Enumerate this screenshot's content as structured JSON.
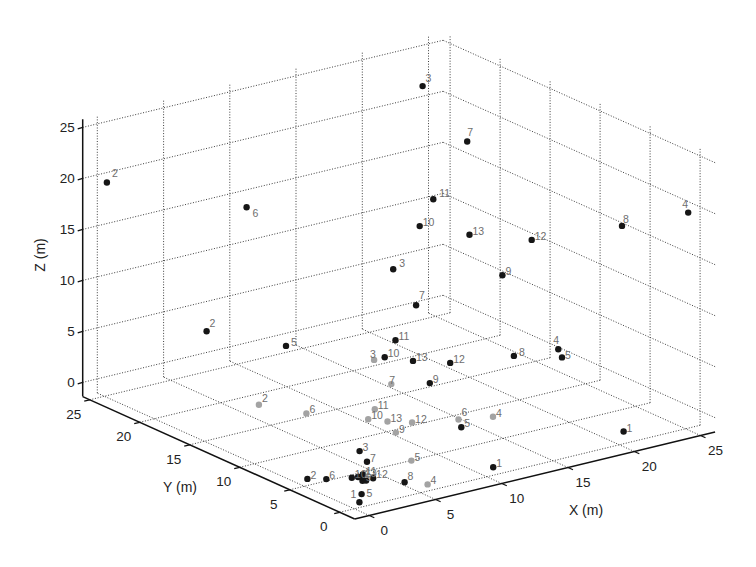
{
  "figure": {
    "background": "#ffffff"
  },
  "chart_data": {
    "type": "scatter",
    "dimensions": 3,
    "title": "",
    "xlabel": "X (m)",
    "ylabel": "Y (m)",
    "zlabel": "Z (m)",
    "xlim": [
      -1.1,
      26.1
    ],
    "ylim": [
      -1.5,
      25.7
    ],
    "zlim": [
      -1.4,
      25.8
    ],
    "xticks": [
      0,
      5,
      10,
      15,
      20,
      25
    ],
    "yticks": [
      0,
      5,
      10,
      15,
      20,
      25
    ],
    "zticks": [
      0,
      5,
      10,
      15,
      20,
      25
    ],
    "grid": true,
    "grid_style": "dotted",
    "legend": null,
    "label_color": "#6e6e6e",
    "series": [
      {
        "id": "dark",
        "color": "#161616",
        "points": [
          {
            "label": "2",
            "x": 0.2,
            "y": 25.0,
            "z": 19.5,
            "ldx": 5,
            "ldy": -6
          },
          {
            "label": "6",
            "x": 3.8,
            "y": 15.8,
            "z": 20,
            "ldx": 6,
            "ldy": 10
          },
          {
            "label": "3",
            "x": 20.1,
            "y": 19.8,
            "z": 25,
            "ldy": -4
          },
          {
            "label": "7",
            "x": 21.8,
            "y": 17.6,
            "z": 20,
            "ldx": 0,
            "ldy": -6
          },
          {
            "label": "8",
            "x": 20.2,
            "y": 0.0,
            "z": 20,
            "ldx": 1,
            "ldy": -3
          },
          {
            "label": "4",
            "x": 24.9,
            "y": -0.4,
            "z": 20,
            "ldx": -6,
            "ldy": -5
          },
          {
            "label": "11",
            "x": 19.4,
            "y": 17.8,
            "z": 15,
            "ldx": 6,
            "ldy": -2
          },
          {
            "label": "10",
            "x": 15.8,
            "y": 14.4,
            "z": 15
          },
          {
            "label": "13",
            "x": 17.3,
            "y": 11.4,
            "z": 15
          },
          {
            "label": "12",
            "x": 19.8,
            "y": 8.5,
            "z": 15
          },
          {
            "label": "3",
            "x": 9.8,
            "y": 9.1,
            "z": 15,
            "ldx": 6,
            "ldy": -2
          },
          {
            "label": "9",
            "x": 14.5,
            "y": 4.4,
            "z": 15
          },
          {
            "label": "7",
            "x": 7.0,
            "y": 3.1,
            "z": 15,
            "ldy": -6
          },
          {
            "label": "2",
            "x": 5.0,
            "y": 21.4,
            "z": 5,
            "ldy": -4
          },
          {
            "label": "5",
            "x": 7.3,
            "y": 16.5,
            "z": 5,
            "ldx": 5
          },
          {
            "label": "11",
            "x": 13.3,
            "y": 13.5,
            "z": 5
          },
          {
            "label": "10",
            "x": 10.9,
            "y": 11.4,
            "z": 5
          },
          {
            "label": "13",
            "x": 11.9,
            "y": 9.9,
            "z": 5
          },
          {
            "label": "12",
            "x": 13.5,
            "y": 8.3,
            "z": 5
          },
          {
            "label": "9",
            "x": 10.3,
            "y": 6.1,
            "z": 5
          },
          {
            "label": "8",
            "x": 17.4,
            "y": 7.1,
            "z": 5,
            "ldx": 5
          },
          {
            "label": "4",
            "x": 20.3,
            "y": 6.5,
            "z": 5,
            "ldx": -5,
            "ldy": -5
          },
          {
            "label": "5",
            "x": 19.6,
            "y": 5.2,
            "z": 5,
            "ldy": 2
          },
          {
            "label": "3",
            "x": 5.0,
            "y": 6.1,
            "z": 0
          },
          {
            "label": "7",
            "x": 4.2,
            "y": 4.3,
            "z": 0
          },
          {
            "label": "2",
            "x": -0.6,
            "y": 3.9,
            "z": 0
          },
          {
            "label": "6",
            "x": 0.3,
            "y": 3.2,
            "z": 0
          },
          {
            "label": "11",
            "x": 2.6,
            "y": 2.6,
            "z": 0
          },
          {
            "label": "10",
            "x": 1.7,
            "y": 2.5,
            "z": 0
          },
          {
            "label": "13",
            "x": 2.3,
            "y": 2.3,
            "z": 0
          },
          {
            "label": "12",
            "x": 2.7,
            "y": 1.7,
            "z": 0
          },
          {
            "label": "9",
            "x": 1.9,
            "y": 1.7,
            "z": 0
          },
          {
            "label": null,
            "x": 2.1,
            "y": 2.4,
            "z": 0
          },
          {
            "label": null,
            "x": 2.1,
            "y": 1.6,
            "z": 0
          },
          {
            "label": "5",
            "x": 0.4,
            "y": -0.2,
            "z": 0,
            "ldx": 5,
            "ldy": 3
          },
          {
            "label": "1",
            "x": -0.6,
            "y": -1.3,
            "z": 0,
            "ldx": -9,
            "ldy": -4
          },
          {
            "label": "8",
            "x": 3.8,
            "y": 0.0,
            "z": 0,
            "ldy": -2
          },
          {
            "label": "1",
            "x": 9.8,
            "y": -0.9,
            "z": 0
          },
          {
            "label": "5",
            "x": 12.6,
            "y": 6.0,
            "z": 0
          },
          {
            "label": "1",
            "x": 20.1,
            "y": -0.3,
            "z": 0
          }
        ]
      },
      {
        "id": "light",
        "color": "#a3a3a3",
        "points": [
          {
            "label": "3",
            "x": 10.1,
            "y": 11.4,
            "z": 5,
            "ldx": -4,
            "ldy": -2
          },
          {
            "label": "7",
            "x": 8.3,
            "y": 7.3,
            "z": 5,
            "ldx": -2
          },
          {
            "label": "2",
            "x": 5.1,
            "y": 16.3,
            "z": 0,
            "ldy": -3
          },
          {
            "label": "6",
            "x": 6.5,
            "y": 13.4,
            "z": 0
          },
          {
            "label": "11",
            "x": 10.3,
            "y": 11.6,
            "z": 0
          },
          {
            "label": "10",
            "x": 8.9,
            "y": 10.4,
            "z": 0
          },
          {
            "label": "13",
            "x": 9.6,
            "y": 9.4,
            "z": 0
          },
          {
            "label": "12",
            "x": 10.7,
            "y": 8.4,
            "z": 0
          },
          {
            "label": "9",
            "x": 8.8,
            "y": 7.5,
            "z": 0
          },
          {
            "label": "6",
            "x": 13.3,
            "y": 7.2,
            "z": 0,
            "ldy": -4
          },
          {
            "label": "4",
            "x": 15.3,
            "y": 6.4,
            "z": 0
          },
          {
            "label": "5",
            "x": 6.5,
            "y": 2.9,
            "z": 0
          },
          {
            "label": "4",
            "x": 4.7,
            "y": -1.1,
            "z": 0
          }
        ]
      }
    ]
  }
}
